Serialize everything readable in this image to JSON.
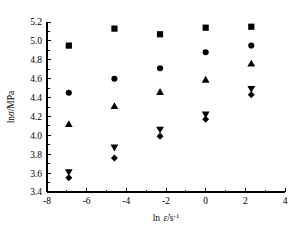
{
  "chart_data": {
    "type": "scatter",
    "title": "",
    "xlabel": "ln ε̇/s⁻¹",
    "ylabel": "lnσ/MPa",
    "xlim": [
      -8,
      4
    ],
    "ylim": [
      3.4,
      5.2
    ],
    "xticks": [
      -8,
      -6,
      -4,
      -2,
      0,
      2,
      4
    ],
    "xticklabels": [
      "-8",
      "-6",
      "-4",
      "-2",
      "0",
      "2",
      "4"
    ],
    "yticks": [
      3.4,
      3.6,
      3.8,
      4.0,
      4.2,
      4.4,
      4.6,
      4.8,
      5.0,
      5.2
    ],
    "yticklabels": [
      "3.4",
      "3.6",
      "3.8",
      "4.0",
      "4.2",
      "4.4",
      "4.6",
      "4.8",
      "5.0",
      "5.2"
    ],
    "grid": false,
    "legend": "none",
    "x": [
      -6.9,
      -4.6,
      -2.3,
      0.0,
      2.3
    ],
    "series": [
      {
        "name": "series-square",
        "marker": "square",
        "values": [
          4.95,
          5.13,
          5.07,
          5.14,
          5.15
        ]
      },
      {
        "name": "series-circle",
        "marker": "circle",
        "values": [
          4.45,
          4.6,
          4.71,
          4.88,
          4.95
        ]
      },
      {
        "name": "series-triangle-up",
        "marker": "triangle-up",
        "values": [
          4.12,
          4.31,
          4.46,
          4.59,
          4.76
        ]
      },
      {
        "name": "series-triangle-down",
        "marker": "triangle-down",
        "values": [
          3.61,
          3.87,
          4.06,
          4.22,
          4.49
        ]
      },
      {
        "name": "series-diamond",
        "marker": "diamond",
        "values": [
          3.55,
          3.76,
          3.99,
          4.17,
          4.43
        ]
      }
    ]
  }
}
